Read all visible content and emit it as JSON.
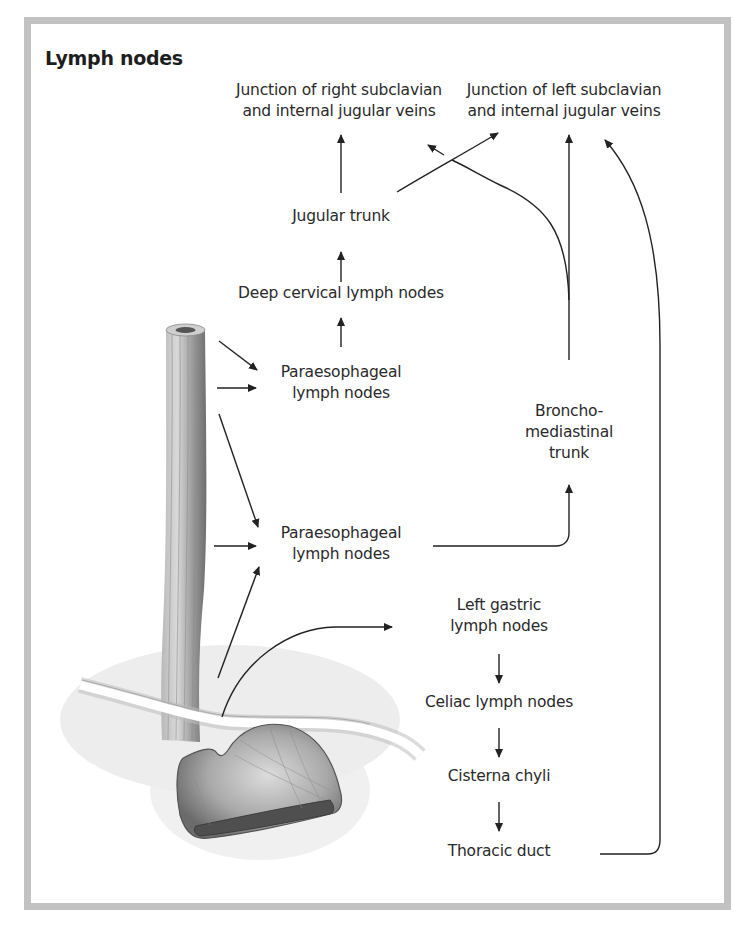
{
  "title": "Lymph nodes",
  "colors": {
    "frame": "#c2c2c2",
    "text": "#2a2a2a",
    "arrows": "#222222",
    "organ_shade": "#8a8a8a"
  },
  "nodes": {
    "junction_right": {
      "line1": "Junction of right subclavian",
      "line2": "and internal jugular veins"
    },
    "junction_left": {
      "line1": "Junction of left subclavian",
      "line2": "and internal jugular veins"
    },
    "jugular_trunk": {
      "line1": "Jugular trunk"
    },
    "deep_cervical": {
      "line1": "Deep cervical lymph nodes"
    },
    "paraesophageal_upper": {
      "line1": "Paraesophageal",
      "line2": "lymph nodes"
    },
    "bronchomediastinal": {
      "line1": "Broncho-",
      "line2": "mediastinal",
      "line3": "trunk"
    },
    "paraesophageal_lower": {
      "line1": "Paraesophageal",
      "line2": "lymph nodes"
    },
    "left_gastric": {
      "line1": "Left gastric",
      "line2": "lymph nodes"
    },
    "celiac": {
      "line1": "Celiac lymph nodes"
    },
    "cisterna_chyli": {
      "line1": "Cisterna chyli"
    },
    "thoracic_duct": {
      "line1": "Thoracic duct"
    }
  },
  "illustration": {
    "organs": [
      "esophagus",
      "diaphragm",
      "stomach"
    ]
  }
}
